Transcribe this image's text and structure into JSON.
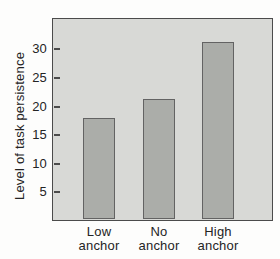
{
  "chart_data": {
    "type": "bar",
    "title": "",
    "xlabel": "",
    "ylabel": "Level of task persistence",
    "categories": [
      {
        "line1": "Low",
        "line2": "anchor"
      },
      {
        "line1": "No",
        "line2": "anchor"
      },
      {
        "line1": "High",
        "line2": "anchor"
      }
    ],
    "values": [
      17.8,
      21,
      31
    ],
    "yticks": [
      5,
      10,
      15,
      20,
      25,
      30
    ],
    "ylim": [
      0,
      35.5
    ],
    "grid": false,
    "legend": "none",
    "colors": {
      "page_background": "#fdfdfc",
      "plot_background": "#d8d9d6",
      "bar_fill": "#abada9",
      "bar_border": "#636363",
      "frame_border": "#4b4b4b",
      "text": "#242424"
    }
  }
}
